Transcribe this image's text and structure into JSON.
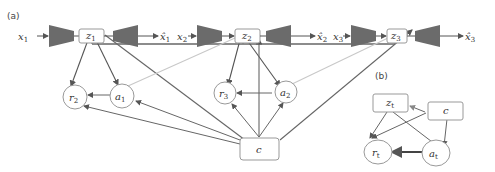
{
  "panels": {
    "a_label": "(a)",
    "b_label": "(b)"
  },
  "panel_a": {
    "inputs": [
      {
        "base": "x",
        "sub": "1"
      },
      {
        "base": "x",
        "sub": "2"
      },
      {
        "base": "x",
        "sub": "3"
      }
    ],
    "latents": [
      {
        "base": "z",
        "sub": "1"
      },
      {
        "base": "z",
        "sub": "2"
      },
      {
        "base": "z",
        "sub": "3"
      }
    ],
    "reconstructions": [
      {
        "base": "x̂",
        "sub": "1"
      },
      {
        "base": "x̂",
        "sub": "2"
      },
      {
        "base": "x̂",
        "sub": "3"
      }
    ],
    "rewards": [
      {
        "base": "r",
        "sub": "2"
      },
      {
        "base": "r",
        "sub": "3"
      }
    ],
    "actions": [
      {
        "base": "a",
        "sub": "1"
      },
      {
        "base": "a",
        "sub": "2"
      }
    ],
    "context": {
      "base": "c"
    }
  },
  "panel_b": {
    "latent": {
      "base": "z",
      "sub": "t"
    },
    "context": {
      "base": "c"
    },
    "reward": {
      "base": "r",
      "sub": "t"
    },
    "action": {
      "base": "a",
      "sub": "t"
    }
  },
  "colors": {
    "encoder_fill": "#6b6b6b",
    "edge_dark": "#555555",
    "edge_light": "#c8c8c8",
    "node_stroke": "#9a9a9a"
  }
}
